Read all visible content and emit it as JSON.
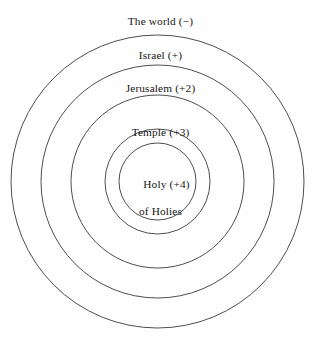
{
  "diagram": {
    "type": "concentric-circles",
    "background_color": "#fefefe",
    "stroke_color": "#3a3a3a",
    "text_color": "#161616",
    "center": {
      "x": 157.5,
      "y": 181.5
    },
    "rings": [
      {
        "id": "world",
        "label": "The world (−)",
        "value": "−",
        "radius": 146.5,
        "label_top": 15
      },
      {
        "id": "israel",
        "label": "Israel (+)",
        "value": "+",
        "radius": 116.5,
        "label_top": 49
      },
      {
        "id": "jerusalem",
        "label": "Jerusalem (+2)",
        "value": "+2",
        "radius": 86.5,
        "label_top": 82
      },
      {
        "id": "temple",
        "label": "Temple (+3)",
        "value": "+3",
        "radius": 52.5,
        "label_top": 126
      },
      {
        "id": "holy-of-holies",
        "label_line_1": "Holy (+4)",
        "label_line_2": "of Holies",
        "value": "+4",
        "radius": 38.5,
        "label_top": 164
      }
    ]
  }
}
